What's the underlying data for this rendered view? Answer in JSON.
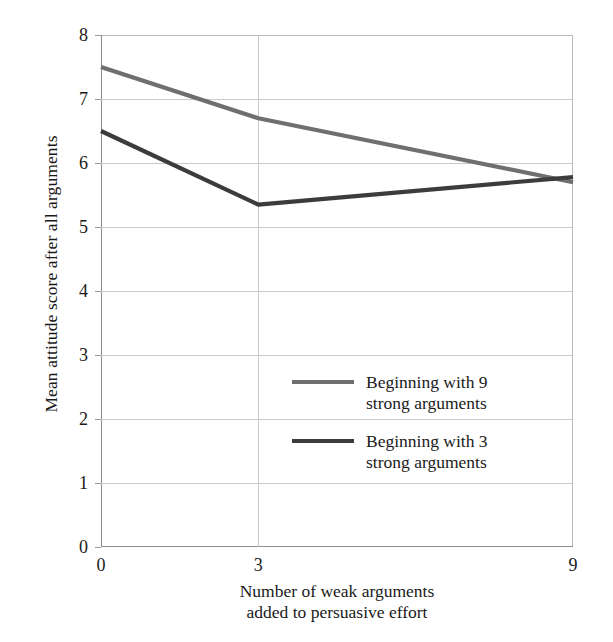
{
  "chart_data": {
    "type": "line",
    "title": "",
    "xlabel": "Number of weak arguments\nadded to persuasive effort",
    "ylabel": "Mean attitude score after all arguments",
    "x": [
      0,
      3,
      9
    ],
    "xticklabels": [
      "0",
      "3",
      "9"
    ],
    "yticklabels": [
      "0",
      "1",
      "2",
      "3",
      "4",
      "5",
      "6",
      "7",
      "8"
    ],
    "xlim": [
      0,
      9
    ],
    "ylim": [
      0,
      8
    ],
    "grid": "horizontal-and-vertical",
    "legend_position": "inside-center-lower",
    "series": [
      {
        "name": "Beginning with 9\nstrong arguments",
        "color": "#6f6f6f",
        "values": [
          7.5,
          6.7,
          5.7
        ]
      },
      {
        "name": "Beginning with 3\nstrong arguments",
        "color": "#3c3c3c",
        "values": [
          6.5,
          5.35,
          5.78
        ]
      }
    ]
  },
  "axes": {
    "y_title": "Mean attitude score after all arguments",
    "x_title_line1": "Number of weak arguments",
    "x_title_line2": "added to persuasive effort",
    "y_ticks": [
      {
        "label": "8",
        "value": 8
      },
      {
        "label": "7",
        "value": 7
      },
      {
        "label": "6",
        "value": 6
      },
      {
        "label": "5",
        "value": 5
      },
      {
        "label": "4",
        "value": 4
      },
      {
        "label": "3",
        "value": 3
      },
      {
        "label": "2",
        "value": 2
      },
      {
        "label": "1",
        "value": 1
      },
      {
        "label": "0",
        "value": 0
      }
    ],
    "x_ticks": [
      {
        "label": "0",
        "value": 0
      },
      {
        "label": "3",
        "value": 3
      },
      {
        "label": "9",
        "value": 9
      }
    ]
  },
  "legend": {
    "entries": [
      {
        "label": "Beginning with 9\nstrong arguments",
        "color": "#6f6f6f"
      },
      {
        "label": "Beginning with 3\nstrong arguments",
        "color": "#3c3c3c"
      }
    ]
  },
  "colors": {
    "series_light": "#6f6f6f",
    "series_dark": "#3c3c3c",
    "gridline": "#c9c9c9",
    "axis": "#8d8d8d",
    "text": "#1a1a1a",
    "background": "#ffffff"
  }
}
